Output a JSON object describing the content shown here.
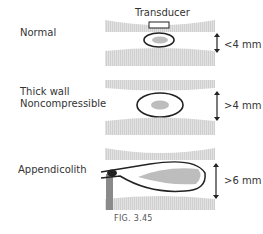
{
  "figure": {
    "caption": "FIG. 3.45",
    "transducer_label": "Transducer",
    "panels": [
      {
        "label_lines": [
          "Normal"
        ],
        "measurement": "<4 mm"
      },
      {
        "label_lines": [
          "Thick wall",
          "Noncompressible"
        ],
        "measurement": ">4 mm"
      },
      {
        "label_lines": [
          "Appendicolith"
        ],
        "measurement": ">6 mm"
      }
    ]
  },
  "colors": {
    "tissue": "#d9d9d9",
    "lumen": "#bdbdbd",
    "outline": "#222222",
    "appendicolith_shadow": "#8a8a8a"
  }
}
